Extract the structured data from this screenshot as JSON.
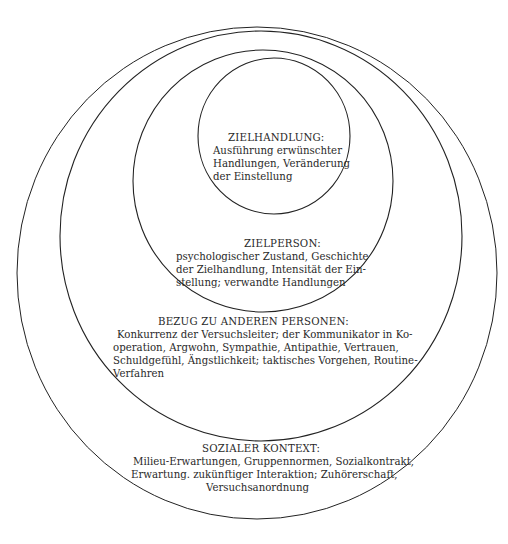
{
  "diagram": {
    "type": "nested-circles",
    "colors": {
      "line": "#222222",
      "text": "#2a2a2a",
      "background": "#ffffff"
    },
    "levels": [
      {
        "id": "zielhandlung",
        "title": "ZIELHANDLUNG:",
        "lines": [
          "Ausführung erwünschter",
          "Handlungen, Veränderung",
          "der Einstellung"
        ]
      },
      {
        "id": "zielperson",
        "title": "ZIELPERSON:",
        "lines": [
          "psychologischer Zustand, Geschichte",
          "der Zielhandlung, Intensität der Ein-",
          "stellung; verwandte Handlungen"
        ]
      },
      {
        "id": "bezug",
        "title": "BEZUG ZU ANDEREN PERSONEN:",
        "lines": [
          "Konkurrenz der Versuchsleiter; der Kommunikator in Ko-",
          "operation, Argwohn, Sympathie, Antipathie, Vertrauen,",
          "Schuldgefühl, Ängstlichkeit; taktisches Vorgehen, Routine-",
          "Verfahren"
        ]
      },
      {
        "id": "sozialer-kontext",
        "title": "SOZIALER KONTEXT:",
        "lines": [
          "Milieu-Erwartungen, Gruppennormen, Sozialkontrakt,",
          "Erwartung. zukünftiger Interaktion; Zuhörerschaft,",
          "Versuchsanordnung"
        ]
      }
    ]
  }
}
